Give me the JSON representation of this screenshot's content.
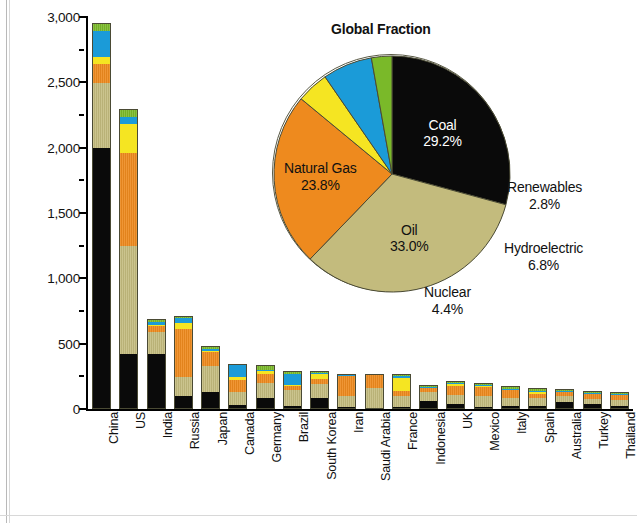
{
  "chart_data": [
    {
      "type": "bar",
      "subtype": "stacked-vertical",
      "title": "",
      "xlabel": "",
      "ylabel": "E (Million tons oil equivalent)",
      "ylim": [
        0,
        3000
      ],
      "yticks": [
        0,
        500,
        1000,
        1500,
        2000,
        2500,
        3000
      ],
      "ytick_labels": [
        "0",
        "500",
        "1,000",
        "1,500",
        "2,000",
        "2,500",
        "3,000"
      ],
      "yminor_ticks": [
        250,
        750,
        1250,
        1750,
        2250,
        2750
      ],
      "grid": false,
      "legend": "none",
      "categories": [
        "China",
        "US",
        "India",
        "Russia",
        "Japan",
        "Canada",
        "Germany",
        "Brazil",
        "South Korea",
        "Iran",
        "Saudi Arabia",
        "France",
        "Indonesia",
        "UK",
        "Mexico",
        "Italy",
        "Spain",
        "Australia",
        "Turkey",
        "Thailand"
      ],
      "series": [
        {
          "name": "Coal",
          "color": "#0a0a0a",
          "values": [
            1990,
            410,
            410,
            95,
            120,
            22,
            80,
            15,
            80,
            1,
            0,
            9,
            55,
            31,
            10,
            13,
            15,
            50,
            34,
            16
          ]
        },
        {
          "name": "Oil",
          "color": "#c3bb7d",
          "values": [
            500,
            830,
            170,
            145,
            200,
            102,
            110,
            125,
            110,
            85,
            150,
            82,
            72,
            71,
            86,
            62,
            65,
            45,
            34,
            52
          ]
        },
        {
          "name": "Natural Gas",
          "color": "#ee8a1e",
          "values": [
            145,
            710,
            45,
            370,
            105,
            92,
            75,
            28,
            45,
            160,
            100,
            38,
            38,
            70,
            72,
            62,
            28,
            30,
            40,
            45
          ]
        },
        {
          "name": "Nuclear",
          "color": "#f5e522",
          "values": [
            48,
            220,
            9,
            45,
            10,
            24,
            22,
            4,
            38,
            0,
            0,
            100,
            0,
            16,
            2,
            0,
            14,
            0,
            0,
            0
          ]
        },
        {
          "name": "Hydroelectric",
          "color": "#1b9bd8",
          "values": [
            205,
            60,
            28,
            42,
            19,
            88,
            5,
            90,
            1,
            3,
            0,
            14,
            3,
            1,
            7,
            12,
            8,
            4,
            12,
            1
          ]
        },
        {
          "name": "Renewables",
          "color": "#7ab929",
          "values": [
            52,
            50,
            12,
            1,
            10,
            5,
            33,
            15,
            3,
            0,
            0,
            7,
            3,
            9,
            5,
            9,
            17,
            6,
            3,
            3
          ]
        }
      ]
    },
    {
      "type": "pie",
      "title": "Global Fraction",
      "labels": [
        "Coal",
        "Oil",
        "Natural Gas",
        "Nuclear",
        "Hydroelectric",
        "Renewables"
      ],
      "values": [
        29.2,
        33.0,
        23.8,
        4.4,
        6.8,
        2.8
      ],
      "value_labels": [
        "29.2%",
        "33.0%",
        "23.8%",
        "4.4%",
        "6.8%",
        "2.8%"
      ],
      "colors": [
        "#0a0a0a",
        "#c3bb7d",
        "#ee8a1e",
        "#f5e522",
        "#1b9bd8",
        "#7ab929"
      ],
      "start_angle_deg": 0,
      "direction": "clockwise"
    }
  ],
  "axis": {
    "y_title": "E (Million tons oil equivalent)",
    "y_tick_labels": [
      "3,000",
      "2,500",
      "2,000",
      "1,500",
      "1,000",
      "500",
      "0"
    ]
  },
  "pie": {
    "title": "Global Fraction",
    "slices": [
      {
        "name": "Coal",
        "percent": "29.2%",
        "label": "Coal"
      },
      {
        "name": "Oil",
        "percent": "33.0%",
        "label": "Oil"
      },
      {
        "name": "Natural Gas",
        "percent": "23.8%",
        "label": "Natural Gas"
      },
      {
        "name": "Nuclear",
        "percent": "4.4%",
        "label": "Nuclear"
      },
      {
        "name": "Hydroelectric",
        "percent": "6.8%",
        "label": "Hydroelectric"
      },
      {
        "name": "Renewables",
        "percent": "2.8%",
        "label": "Renewables"
      }
    ]
  },
  "colors": {
    "coal": "#0a0a0a",
    "oil": "#c3bb7d",
    "natural_gas": "#ee8a1e",
    "nuclear": "#f5e522",
    "hydroelectric": "#1b9bd8",
    "renewables": "#7ab929",
    "outline": "#4a4a34"
  }
}
